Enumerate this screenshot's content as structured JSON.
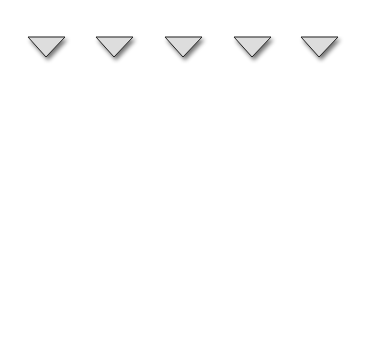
{
  "belt": {
    "label": "conveyor belt"
  },
  "robots": [
    {
      "id": "R1",
      "type_label": "existing robot",
      "kind": "existing"
    },
    {
      "id": "R2",
      "type_label": "simulated robot",
      "kind": "simulated"
    },
    {
      "id": "R3",
      "type_label": "existing robot",
      "kind": "existing"
    },
    {
      "id": "R4",
      "type_label": "simulated robot",
      "kind": "simulated"
    },
    {
      "id": "R5",
      "type_label": "existing robot",
      "kind": "existing"
    }
  ],
  "bt_nodes": [
    {
      "label": "BT"
    },
    {
      "label": "BT"
    },
    {
      "label": "BT"
    },
    {
      "label": "BT"
    },
    {
      "label": "BT"
    },
    {
      "label": "BT"
    }
  ],
  "cloud": {
    "lines": [
      "composition",
      "analysis",
      "simulation",
      "verification",
      "validation"
    ]
  },
  "outputs": [
    {
      "label": "visualization"
    },
    {
      "label": "visualization"
    }
  ],
  "colors": {
    "robot_fill": "#eeeeee",
    "stroke": "#222222",
    "shadow": "#888888"
  }
}
